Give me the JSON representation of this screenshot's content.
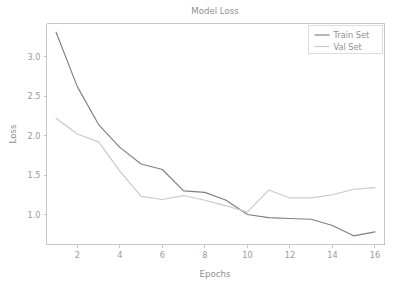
{
  "chart_data": {
    "type": "line",
    "title": "Model Loss",
    "xlabel": "Epochs",
    "ylabel": "Loss",
    "x": [
      1,
      2,
      3,
      4,
      5,
      6,
      7,
      8,
      9,
      10,
      11,
      12,
      13,
      14,
      15,
      16
    ],
    "series": [
      {
        "name": "Train Set",
        "color": "#7f7f7f",
        "values": [
          3.31,
          2.62,
          2.14,
          1.85,
          1.64,
          1.57,
          1.3,
          1.28,
          1.18,
          1.0,
          0.96,
          0.95,
          0.94,
          0.86,
          0.73,
          0.78
        ]
      },
      {
        "name": "Val Set",
        "color": "#c9c9c9",
        "values": [
          2.22,
          2.02,
          1.92,
          1.55,
          1.23,
          1.19,
          1.24,
          1.18,
          1.11,
          1.03,
          1.31,
          1.21,
          1.21,
          1.25,
          1.32,
          1.34
        ]
      }
    ],
    "xlim": [
      0.55,
      16.45
    ],
    "ylim": [
      0.62,
      3.42
    ],
    "xticks": [
      2,
      4,
      6,
      8,
      10,
      12,
      14,
      16
    ],
    "xtick_labels": [
      "2",
      "4",
      "6",
      "8",
      "10",
      "12",
      "14",
      "16"
    ],
    "yticks": [
      1.0,
      1.5,
      2.0,
      2.5,
      3.0
    ],
    "ytick_labels": [
      "1.0",
      "1.5",
      "2.0",
      "2.5",
      "3.0"
    ],
    "grid": false,
    "legend_position": "upper right",
    "legend_entries": [
      "Train Set",
      "Val Set"
    ]
  },
  "figure": {
    "background_color": "#ffffff",
    "axes_color": "#b9b9b9",
    "text_color": "#8f8f8f"
  }
}
